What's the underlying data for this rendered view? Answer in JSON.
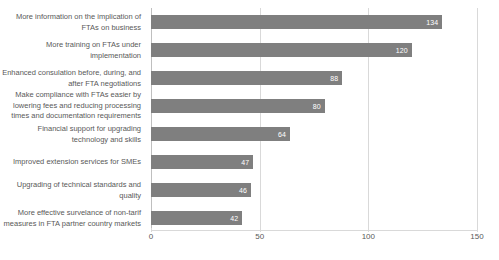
{
  "chart_data": {
    "type": "bar",
    "orientation": "horizontal",
    "title": "",
    "xlabel": "",
    "ylabel": "",
    "xlim": [
      0,
      150
    ],
    "xticks": [
      0,
      50,
      100,
      150
    ],
    "grid": true,
    "legend": false,
    "bar_color": "#7f7f7f",
    "label_color": "#595959",
    "gridline_color": "#d9d9d9",
    "categories": [
      "More information on the implication of FTAs on business",
      "More training on FTAs under implementation",
      "Enhanced consulation before, during, and after FTA negotiations",
      "Make compliance with FTAs easier by lowering fees and reducing processing times and documentation requirements",
      "Financial support for upgrading technology and skills",
      "Improved extension services for SMEs",
      "Upgrading of technical standards and quality",
      "More effective survelance of non-tarif measures in FTA partner country markets"
    ],
    "values": [
      134,
      120,
      88,
      80,
      64,
      47,
      46,
      42
    ],
    "value_labels": [
      "134",
      "120",
      "88",
      "80",
      "64",
      "47",
      "46",
      "42"
    ],
    "tick_labels": [
      "0",
      "50",
      "100",
      "150"
    ]
  }
}
